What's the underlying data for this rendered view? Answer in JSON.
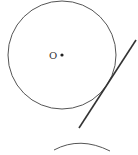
{
  "diagram": {
    "colors": {
      "stroke": "#555555",
      "line": "#333333",
      "background": "#ffffff"
    },
    "circle": {
      "center_label": "O",
      "cx": 62,
      "cy": 55,
      "r": 54
    },
    "line": {
      "x1": 136,
      "y1": 40,
      "x2": 79,
      "y2": 128
    },
    "lower_arc": {
      "cx": 80,
      "cy": 190,
      "r": 45
    }
  }
}
